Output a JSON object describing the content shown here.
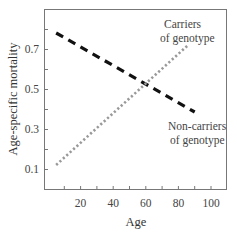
{
  "chart_data": {
    "type": "line",
    "title": "",
    "xlabel": "Age",
    "ylabel": "Age-specific mortality",
    "xlim": [
      0,
      108
    ],
    "ylim": [
      0.0,
      0.9
    ],
    "x_ticks": [
      20,
      40,
      60,
      80,
      100
    ],
    "x_minor_ticks": [
      10,
      20,
      30,
      40,
      50,
      60,
      70,
      80,
      90,
      100
    ],
    "y_ticks": [
      0.1,
      0.3,
      0.5,
      0.7
    ],
    "y_tick_labels": [
      "0.1",
      "0.3",
      "0.5",
      "0.7"
    ],
    "y_minor_ticks": [
      0.1,
      0.2,
      0.3,
      0.4,
      0.5,
      0.6,
      0.7,
      0.8
    ],
    "grid": false,
    "legend": "inline annotations",
    "series": [
      {
        "name": "Non-carriers of genotype",
        "style": "dashed",
        "color": "#111111",
        "x": [
          5,
          90
        ],
        "y": [
          0.78,
          0.385
        ]
      },
      {
        "name": "Carriers of genotype",
        "style": "dotted",
        "color": "#999999",
        "x": [
          5,
          86
        ],
        "y": [
          0.12,
          0.72
        ]
      }
    ],
    "annotations": [
      {
        "text_lines": [
          "Carriers",
          "of genotype"
        ],
        "series": "Carriers of genotype"
      },
      {
        "text_lines": [
          "Non-carriers",
          "of genotype"
        ],
        "series": "Non-carriers of genotype"
      }
    ]
  },
  "labels": {
    "xlabel": "Age",
    "ylabel": "Age-specific mortality",
    "carriers_line1": "Carriers",
    "carriers_line2": "of genotype",
    "noncarriers_line1": "Non-carriers",
    "noncarriers_line2": "of genotype"
  }
}
